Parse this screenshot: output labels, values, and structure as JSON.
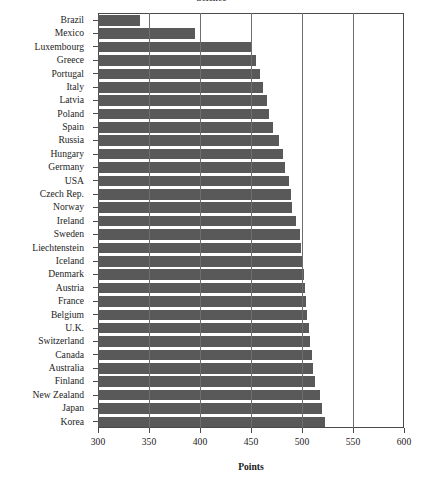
{
  "chart_data": {
    "type": "bar",
    "orientation": "horizontal",
    "title": "Science",
    "xlabel": "Points",
    "ylabel": "",
    "xlim": [
      300,
      600
    ],
    "xticks": [
      300,
      350,
      400,
      450,
      500,
      550,
      600
    ],
    "xtick_labels": [
      "300",
      "350",
      "400",
      "450",
      "500",
      "550",
      "600"
    ],
    "grid": true,
    "legend": false,
    "bar_color": "#595959",
    "categories": [
      "Brazil",
      "Mexico",
      "Luxembourg",
      "Greece",
      "Portugal",
      "Italy",
      "Latvia",
      "Poland",
      "Spain",
      "Russia",
      "Hungary",
      "Germany",
      "USA",
      "Czech Rep.",
      "Norway",
      "Ireland",
      "Sweden",
      "Liechtenstein",
      "Iceland",
      "Denmark",
      "Austria",
      "France",
      "Belgium",
      "U.K.",
      "Switzerland",
      "Canada",
      "Australia",
      "Finland",
      "New Zealand",
      "Japan",
      "Korea"
    ],
    "values": [
      341,
      395,
      450,
      455,
      459,
      462,
      466,
      468,
      472,
      477,
      481,
      483,
      487,
      489,
      490,
      494,
      498,
      499,
      501,
      502,
      503,
      504,
      505,
      507,
      508,
      510,
      511,
      513,
      518,
      520,
      523
    ]
  }
}
